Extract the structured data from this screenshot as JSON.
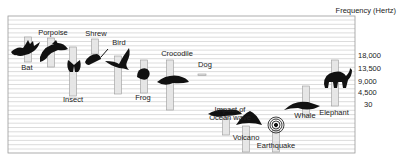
{
  "chart_data": {
    "type": "bar",
    "title": "Frequency (Hertz)",
    "ylabel": "Frequency (Hertz)",
    "xlabel": "",
    "y_tick_labels": [
      "18,000",
      "13,500",
      "9,000",
      "4,500",
      "30"
    ],
    "grid": true,
    "legend": "none",
    "items": [
      {
        "name": "Bat",
        "label_pos": "below",
        "icon": "bat-icon"
      },
      {
        "name": "Porpoise",
        "label_pos": "above",
        "icon": "porpoise-icon"
      },
      {
        "name": "Insect",
        "label_pos": "below",
        "icon": "butterfly-icon"
      },
      {
        "name": "Shrew",
        "label_pos": "above",
        "icon": "shrew-icon"
      },
      {
        "name": "Bird",
        "label_pos": "above",
        "icon": "bird-icon"
      },
      {
        "name": "Frog",
        "label_pos": "below",
        "icon": "frog-icon"
      },
      {
        "name": "Crocodile",
        "label_pos": "above",
        "icon": "crocodile-icon"
      },
      {
        "name": "Dog",
        "label_pos": "above",
        "icon": "none"
      },
      {
        "name": "Impact of Ocean wave",
        "label_pos": "above",
        "icon": "wave-icon"
      },
      {
        "name": "Volcano",
        "label_pos": "below",
        "icon": "volcano-icon"
      },
      {
        "name": "Earthquake",
        "label_pos": "below",
        "icon": "earthquake-icon"
      },
      {
        "name": "Whale",
        "label_pos": "below",
        "icon": "whale-icon"
      },
      {
        "name": "Elephant",
        "label_pos": "below",
        "icon": "elephant-icon"
      }
    ],
    "note": "Bars are vertical frequency-range markers; relative positions reflect range (higher = higher frequency)."
  }
}
